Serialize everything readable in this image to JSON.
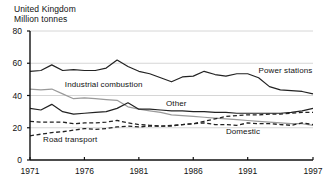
{
  "chart_data": {
    "type": "line",
    "title": "United Kingdom",
    "subtitle": "Million tonnes",
    "xlabel": "",
    "ylabel": "",
    "ylim": [
      0,
      80
    ],
    "xlim": [
      1971,
      1997
    ],
    "yticks": [
      "0",
      "20",
      "40",
      "60",
      "80"
    ],
    "ytick_values": [
      0,
      20,
      40,
      60,
      80
    ],
    "xticks": [
      "1971",
      "1976",
      "1981",
      "1986",
      "1991",
      "1997"
    ],
    "xtick_values": [
      1971,
      1976,
      1981,
      1986,
      1991,
      1997
    ],
    "grid": "horizontal",
    "legend_position": "inline-annotations",
    "x": [
      1971,
      1972,
      1973,
      1974,
      1975,
      1976,
      1977,
      1978,
      1979,
      1980,
      1981,
      1982,
      1983,
      1984,
      1985,
      1986,
      1987,
      1988,
      1989,
      1990,
      1991,
      1992,
      1993,
      1994,
      1995,
      1996,
      1997
    ],
    "series": [
      {
        "name": "Power stations",
        "color": "#222222",
        "style": "solid",
        "label_x": 1992.0,
        "label_y": 55.5,
        "values": [
          55,
          55.5,
          59,
          55.5,
          56,
          55.5,
          55.5,
          57,
          62,
          58,
          55,
          53.5,
          51,
          48.5,
          51.5,
          52,
          55,
          53,
          52,
          53.5,
          53.5,
          51,
          45.5,
          43.5,
          43,
          42.5,
          41
        ]
      },
      {
        "name": "Industrial combustion",
        "color": "#9a9a9a",
        "style": "solid",
        "label_x": 1974.2,
        "label_y": 46.5,
        "values": [
          44,
          43.5,
          44,
          41,
          38,
          38.5,
          38,
          37.5,
          37,
          33,
          31.5,
          30.5,
          29.5,
          28,
          27.5,
          27,
          26.5,
          26,
          25.5,
          25,
          24.5,
          24,
          23.5,
          23,
          22.5,
          22.5,
          21.5
        ]
      },
      {
        "name": "Other",
        "color": "#222222",
        "style": "solid",
        "label_x": 1983.5,
        "label_y": 35.0,
        "values": [
          32,
          31,
          34.5,
          30,
          28.5,
          29,
          29.5,
          30,
          32,
          35.5,
          31.5,
          31.5,
          31,
          30.5,
          30.5,
          30,
          30,
          29.5,
          29.5,
          29,
          29,
          29,
          29,
          29,
          29.5,
          30.5,
          32
        ]
      },
      {
        "name": "Domestic",
        "color": "#222222",
        "style": "dashed",
        "label_x": 1989.0,
        "label_y": 17.5,
        "values": [
          24,
          23.5,
          23.5,
          23.5,
          22.5,
          23,
          23,
          23.5,
          24.5,
          23,
          22,
          21.5,
          21,
          21,
          22,
          22.5,
          23,
          22,
          22,
          21.5,
          23,
          22.5,
          22.5,
          22,
          21.5,
          23,
          22
        ]
      },
      {
        "name": "Road transport",
        "color": "#222222",
        "style": "dashed",
        "label_x": 1972.2,
        "label_y": 12.5,
        "values": [
          15,
          16,
          17,
          17.5,
          18.5,
          19.5,
          19,
          19.5,
          20.5,
          21,
          20.5,
          21,
          21,
          21.5,
          22,
          22.5,
          24,
          25.5,
          27,
          27.5,
          28,
          28,
          28.5,
          28.5,
          29,
          29.5,
          29.5
        ]
      }
    ]
  }
}
